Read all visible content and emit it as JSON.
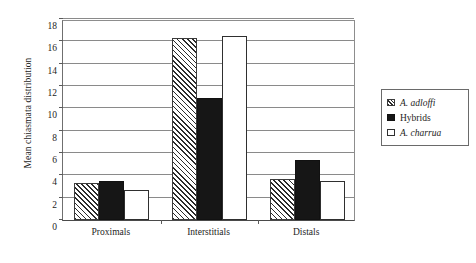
{
  "chart_data": {
    "type": "bar",
    "title": "",
    "xlabel": "",
    "ylabel": "Mean chiasmata distribution",
    "ylim": [
      0,
      18
    ],
    "ytick_step": 2,
    "yticks": [
      0,
      2,
      4,
      6,
      8,
      10,
      12,
      14,
      16,
      18
    ],
    "ytick_labels": [
      "0",
      "2",
      "4",
      "6",
      "8",
      "10",
      "12",
      "14",
      "16",
      "18"
    ],
    "grid": "horizontal",
    "legend_position": "right-outside",
    "categories": [
      "Proximals",
      "Interstitials",
      "Distals"
    ],
    "series": [
      {
        "name": "A. adloffi",
        "style": "hatched",
        "italic": true,
        "values": [
          3.3,
          16.3,
          3.7
        ]
      },
      {
        "name": "Hybrids",
        "style": "solid-black",
        "italic": false,
        "values": [
          3.5,
          10.9,
          5.4
        ]
      },
      {
        "name": "A. charrua",
        "style": "open-white",
        "italic": true,
        "values": [
          2.7,
          16.5,
          3.5
        ]
      }
    ]
  },
  "colors": {
    "hatch_line": "#2b2b2b",
    "solid_fill": "#161616",
    "open_fill": "#ffffff",
    "gridline": "#8a8a8a",
    "axis": "#4a4a4a",
    "text": "#1d1d1d"
  }
}
